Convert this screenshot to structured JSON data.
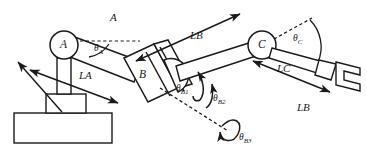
{
  "figure": {
    "type": "engineering-diagram",
    "background_color": "#ffffff",
    "stroke_color": "#1a1a1a"
  },
  "joints": [
    {
      "id": "A",
      "label": "A",
      "shape": "circle",
      "x": 64,
      "y": 45,
      "r": 14
    },
    {
      "id": "B",
      "label": "B",
      "shape": "block",
      "x": 143,
      "y": 75
    },
    {
      "id": "C",
      "label": "C",
      "shape": "circle",
      "x": 262,
      "y": 45,
      "r": 14
    }
  ],
  "links": [
    {
      "id": "LA",
      "label": "LA",
      "x": 85,
      "y": 75
    },
    {
      "id": "LB-upper",
      "label": "LB",
      "x": 196,
      "y": 35
    },
    {
      "id": "LC",
      "label": "LC",
      "x": 283,
      "y": 68
    },
    {
      "id": "LB-lower",
      "label": "LB",
      "x": 303,
      "y": 107
    }
  ],
  "angles": [
    {
      "id": "theta-A",
      "symbol": "θ",
      "subscript": "A",
      "x": 100,
      "y": 49
    },
    {
      "id": "theta-C",
      "symbol": "θ",
      "subscript": "C",
      "x": 297,
      "y": 39
    },
    {
      "id": "theta-B1",
      "symbol": "θ",
      "subscript": "B1",
      "x": 186,
      "y": 85
    },
    {
      "id": "theta-B2",
      "symbol": "θ",
      "subscript": "B2",
      "x": 215,
      "y": 95
    },
    {
      "id": "theta-B3",
      "symbol": "θ",
      "subscript": "B3",
      "x": 234,
      "y": 135
    }
  ],
  "annotations": [
    {
      "id": "axis-A",
      "label": "A",
      "x": 113,
      "y": 14
    }
  ],
  "base": {
    "name": "pedestal-base",
    "plate": {
      "x": 14,
      "y": 113,
      "w": 98,
      "h": 30
    },
    "riser": {
      "x": 46,
      "y": 94,
      "w": 40,
      "h": 19
    },
    "column": {
      "x": 57,
      "y": 58,
      "w": 14,
      "h": 36
    }
  },
  "end_effector": {
    "name": "gripper",
    "x": 330,
    "y": 72
  }
}
